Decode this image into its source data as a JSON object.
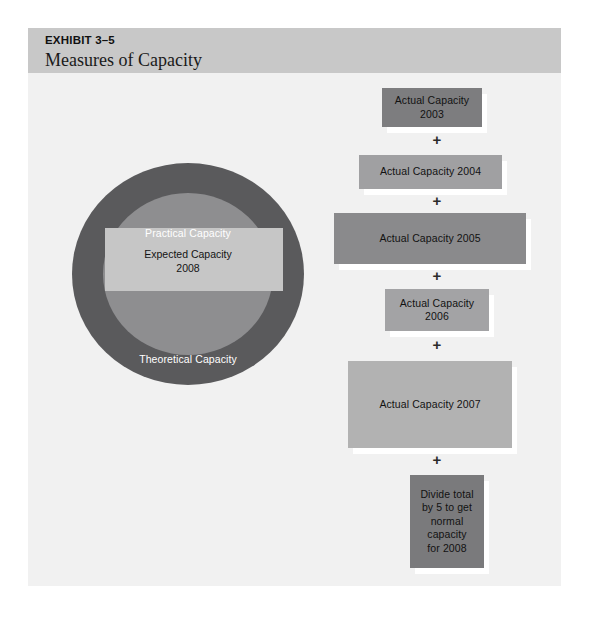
{
  "exhibit": {
    "number": "EXHIBIT 3–5",
    "title": "Measures of Capacity"
  },
  "circle_diagram": {
    "outer_label": "Theoretical Capacity",
    "middle_label": "Practical Capacity",
    "center_label_line1": "Expected Capacity",
    "center_label_line2": "2008",
    "colors": {
      "outer_ring": "#5a5a5c",
      "middle_ring": "#8e8e90",
      "center_rect": "#c6c6c6"
    }
  },
  "flow": {
    "operator": "+",
    "boxes": [
      {
        "id": "actual-capacity-2003",
        "line1": "Actual Capacity",
        "line2": "2003",
        "color": "#7d7d7f",
        "x": 354,
        "y": 60,
        "w": 100,
        "h": 39
      },
      {
        "id": "actual-capacity-2004",
        "line1": "Actual Capacity 2004",
        "line2": "",
        "color": "#a0a0a2",
        "x": 331,
        "y": 127,
        "w": 143,
        "h": 34
      },
      {
        "id": "actual-capacity-2005",
        "line1": "Actual Capacity 2005",
        "line2": "",
        "color": "#8a8a8c",
        "x": 306,
        "y": 185,
        "w": 192,
        "h": 51
      },
      {
        "id": "actual-capacity-2006",
        "line1": "Actual Capacity",
        "line2": "2006",
        "color": "#a3a3a5",
        "x": 357,
        "y": 261,
        "w": 104,
        "h": 42
      },
      {
        "id": "actual-capacity-2007",
        "line1": "Actual Capacity 2007",
        "line2": "",
        "color": "#b2b2b2",
        "x": 320,
        "y": 333,
        "w": 164,
        "h": 87
      },
      {
        "id": "divide-total-box",
        "line1": "Divide total",
        "line2": "by 5 to get",
        "line3": "normal",
        "line4": "capacity",
        "line5": "for 2008",
        "color": "#7a7a7c",
        "x": 382,
        "y": 447,
        "w": 74,
        "h": 93
      }
    ],
    "operators": [
      {
        "x": 398,
        "y": 104
      },
      {
        "x": 398,
        "y": 165
      },
      {
        "x": 398,
        "y": 240
      },
      {
        "x": 398,
        "y": 309
      },
      {
        "x": 398,
        "y": 424
      }
    ]
  }
}
